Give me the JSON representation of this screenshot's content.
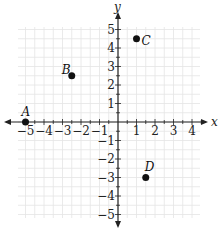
{
  "chart_data": {
    "type": "scatter",
    "title": "",
    "xlabel": "x",
    "ylabel": "y",
    "xlim": [
      -5,
      4.5
    ],
    "ylim": [
      -5,
      5
    ],
    "grid": true,
    "grid_step": 0.5,
    "x_ticks": [
      -5,
      -4,
      -3,
      -2,
      -1,
      1,
      2,
      3,
      4
    ],
    "y_ticks": [
      -5,
      -4,
      -3,
      -2,
      -1,
      1,
      2,
      3,
      4,
      5
    ],
    "points": [
      {
        "label": "A",
        "x": -5,
        "y": 0
      },
      {
        "label": "B",
        "x": -2.5,
        "y": 2.5
      },
      {
        "label": "C",
        "x": 1,
        "y": 4.5
      },
      {
        "label": "D",
        "x": 1.5,
        "y": -3
      }
    ]
  },
  "layout": {
    "origin_px": [
      118,
      122
    ],
    "unit_px": 18.5,
    "grid_bounds_px": {
      "left": 18,
      "right": 200,
      "top": 27,
      "bottom": 218
    },
    "colors": {
      "grid": "#e4e4e4",
      "axis": "#222222",
      "point": "#111111"
    }
  }
}
